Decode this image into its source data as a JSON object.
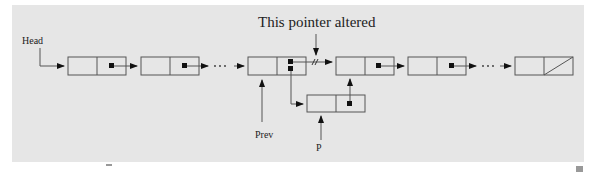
{
  "figure": {
    "title": "This pointer altered",
    "labels": {
      "head": "Head",
      "prev": "Prev",
      "p": "P"
    },
    "colors": {
      "background": "#e6e6e6",
      "line": "#555555",
      "pointer": "#111111"
    },
    "nodes": [
      {
        "id": "node-1",
        "next": "node-2"
      },
      {
        "id": "node-2",
        "next": "ellipsis"
      },
      {
        "id": "node-prev",
        "next": "node-4 (altered to node-p)"
      },
      {
        "id": "node-4",
        "next": "node-5"
      },
      {
        "id": "node-5",
        "next": "ellipsis"
      },
      {
        "id": "node-last",
        "next": "null"
      },
      {
        "id": "node-p",
        "next": "node-4"
      }
    ],
    "ellipsis": "· · ·"
  }
}
